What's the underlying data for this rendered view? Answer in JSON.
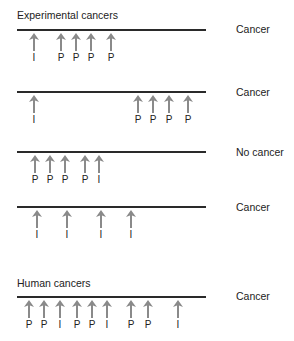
{
  "sections": {
    "experimental_title": "Experimental cancers",
    "human_title": "Human cancers"
  },
  "legend": {
    "I": "Initiator",
    "P": "Promoter"
  },
  "colors": {
    "arrow": "#8a8a8a",
    "line": "#2a2a2a"
  },
  "rows": [
    {
      "line_y": 30,
      "outcome": "Cancer",
      "outcome_y": 23,
      "events": [
        {
          "x": 34,
          "label": "I"
        },
        {
          "x": 61,
          "label": "P"
        },
        {
          "x": 76,
          "label": "P"
        },
        {
          "x": 91,
          "label": "P"
        },
        {
          "x": 111,
          "label": "P"
        }
      ]
    },
    {
      "line_y": 92,
      "outcome": "Cancer",
      "outcome_y": 86,
      "events": [
        {
          "x": 34,
          "label": "I"
        },
        {
          "x": 138,
          "label": "P"
        },
        {
          "x": 153,
          "label": "P"
        },
        {
          "x": 169,
          "label": "P"
        },
        {
          "x": 188,
          "label": "P"
        }
      ]
    },
    {
      "line_y": 152,
      "outcome": "No cancer",
      "outcome_y": 146,
      "events": [
        {
          "x": 35,
          "label": "P"
        },
        {
          "x": 50,
          "label": "P"
        },
        {
          "x": 65,
          "label": "P"
        },
        {
          "x": 85,
          "label": "P"
        },
        {
          "x": 99,
          "label": "I"
        }
      ]
    },
    {
      "line_y": 207,
      "outcome": "Cancer",
      "outcome_y": 201,
      "events": [
        {
          "x": 37,
          "label": "I"
        },
        {
          "x": 67,
          "label": "I"
        },
        {
          "x": 101,
          "label": "I"
        },
        {
          "x": 131,
          "label": "I"
        }
      ]
    },
    {
      "line_y": 297,
      "outcome": "Cancer",
      "outcome_y": 290,
      "events": [
        {
          "x": 29,
          "label": "P"
        },
        {
          "x": 44,
          "label": "P"
        },
        {
          "x": 60,
          "label": "I"
        },
        {
          "x": 77,
          "label": "P"
        },
        {
          "x": 92,
          "label": "P"
        },
        {
          "x": 107,
          "label": "I"
        },
        {
          "x": 131,
          "label": "P"
        },
        {
          "x": 148,
          "label": "P"
        },
        {
          "x": 178,
          "label": "I"
        }
      ]
    }
  ]
}
